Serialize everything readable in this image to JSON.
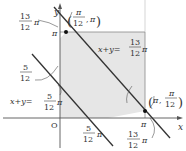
{
  "diagram": {
    "axes": {
      "x_label": "x",
      "y_label": "y",
      "origin_label": "O"
    },
    "ticks": {
      "y_pi": "π",
      "x_pi": "π",
      "y_13_12": {
        "num": "13",
        "den": "12",
        "suffix": "π"
      },
      "y_5_12": {
        "num": "5",
        "den": "12",
        "suffix": "π"
      },
      "x_5_12": {
        "num": "5",
        "den": "12",
        "suffix": "π"
      },
      "x_13_12": {
        "num": "13",
        "den": "12",
        "suffix": "π"
      }
    },
    "lines": [
      {
        "label_lhs": "x+y=",
        "num": "13",
        "den": "12",
        "suffix": "π"
      },
      {
        "label_lhs": "x+y=",
        "num": "5",
        "den": "12",
        "suffix": "π"
      }
    ],
    "points": [
      {
        "label_open": "(",
        "num": "π",
        "den": "12",
        "sep": ",",
        "other": "π",
        "label_close": ")"
      },
      {
        "label_open": "(",
        "first": "π",
        "sep": ",",
        "num": "π",
        "den": "12",
        "label_close": ")"
      }
    ],
    "colors": {
      "shade": "#e6e6e6",
      "line": "#333333",
      "frame": "#888888"
    }
  }
}
